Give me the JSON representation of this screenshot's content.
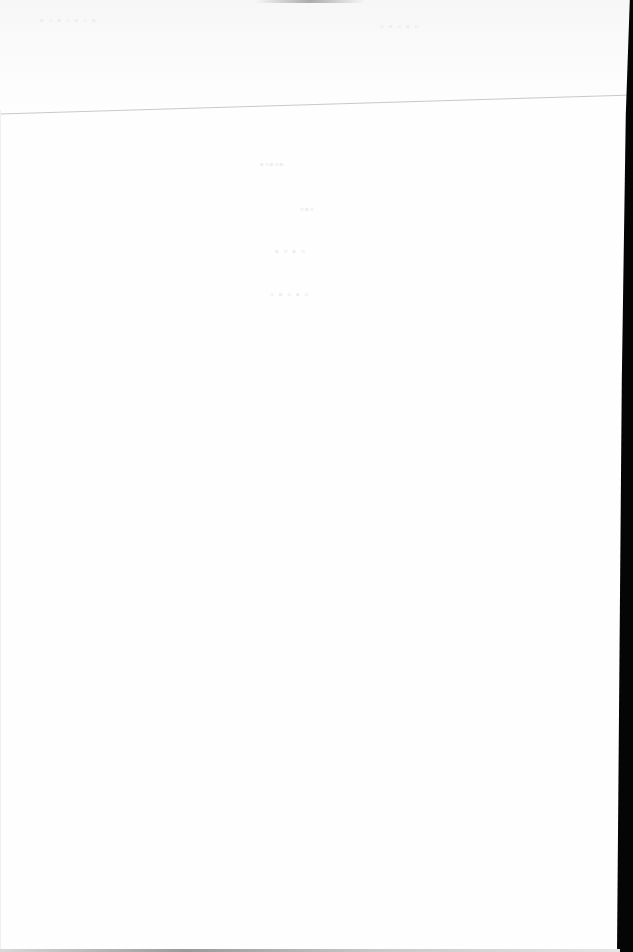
{
  "document": {
    "type": "scanned page",
    "state": "blank / no legible content",
    "visible_text": [],
    "colors": {
      "paper": "#fefefe",
      "header_band": "#f7f7f7",
      "rule_line": "#c9c9c9",
      "scanner_border": "#050505"
    }
  }
}
